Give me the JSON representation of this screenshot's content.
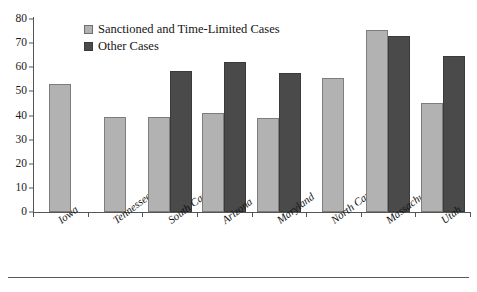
{
  "chart_data": {
    "type": "bar",
    "title": "",
    "xlabel": "",
    "ylabel": "",
    "ylim": [
      0,
      80
    ],
    "ytick_step": 10,
    "yticks": [
      0,
      10,
      20,
      30,
      40,
      50,
      60,
      70,
      80
    ],
    "grid": false,
    "legend_position": "top-left-inside",
    "categories": [
      "Iowa",
      "Tennessee",
      "South Carolina",
      "Arizona",
      "Maryland",
      "North Carolina",
      "Massachusetts",
      "Utah"
    ],
    "series": [
      {
        "name": "Sanctioned and Time-Limited Cases",
        "color": "#b2b2b2",
        "values": [
          53,
          39.5,
          39.5,
          41,
          39,
          55.5,
          75.5,
          45
        ]
      },
      {
        "name": "Other Cases",
        "color": "#4a4a4a",
        "values": [
          null,
          null,
          58.5,
          62,
          57.5,
          null,
          73,
          64.5
        ]
      }
    ]
  },
  "legend": {
    "items": [
      {
        "label": "Sanctioned and Time-Limited Cases",
        "swatch": "light"
      },
      {
        "label": "Other Cases",
        "swatch": "dark"
      }
    ]
  },
  "colors": {
    "series_light": "#b2b2b2",
    "series_dark": "#4a4a4a",
    "axis": "#555555",
    "text": "#141414",
    "background": "#ffffff"
  }
}
